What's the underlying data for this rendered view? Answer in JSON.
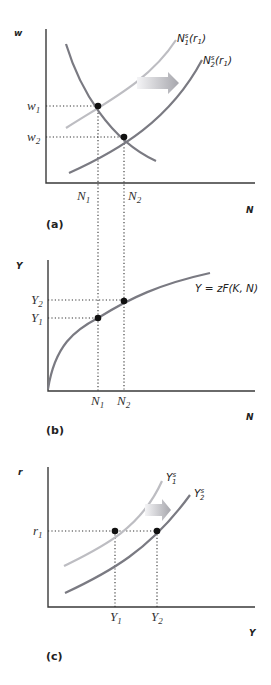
{
  "panels": [
    {
      "id": "a",
      "tag": "(a)",
      "y_axis_label": "w",
      "x_axis_label": "N",
      "y_ticks": {
        "w1": "w",
        "w1_sub": "1",
        "w2": "w",
        "w2_sub": "2"
      },
      "x_ticks": {
        "n1": "N",
        "n1_sub": "1",
        "n2": "N",
        "n2_sub": "2"
      },
      "curves": {
        "supply1": {
          "base": "N",
          "sup": "s",
          "sub": "1",
          "arg": "(r",
          "arg_sub": "1",
          "arg_close": ")"
        },
        "supply2": {
          "base": "N",
          "sup": "s",
          "sub": "2",
          "arg": "(r",
          "arg_sub": "1",
          "arg_close": ")"
        },
        "demand": "labor demand (unlabeled)"
      },
      "shift_arrow": "right"
    },
    {
      "id": "b",
      "tag": "(b)",
      "y_axis_label": "Y",
      "x_axis_label": "N",
      "y_ticks": {
        "y1": "Y",
        "y1_sub": "1",
        "y2": "Y",
        "y2_sub": "2"
      },
      "x_ticks": {
        "n1": "N",
        "n1_sub": "1",
        "n2": "N",
        "n2_sub": "2"
      },
      "curve_label": "Y = zF(K, N)"
    },
    {
      "id": "c",
      "tag": "(c)",
      "y_axis_label": "r",
      "x_axis_label": "Y",
      "y_ticks": {
        "r1": "r",
        "r1_sub": "1"
      },
      "x_ticks": {
        "y1": "Y",
        "y1_sub": "1",
        "y2": "Y",
        "y2_sub": "2"
      },
      "curves": {
        "supply1": {
          "base": "Y",
          "sup": "s",
          "sub": "1"
        },
        "supply2": {
          "base": "Y",
          "sup": "s",
          "sub": "2"
        }
      },
      "shift_arrow": "right"
    }
  ],
  "colors": {
    "curve_dark": "#7a7a82",
    "curve_light": "#bdbdc2",
    "axis": "#3a3a3a",
    "point": "#111111",
    "arrow_start": "#f2f2f4",
    "arrow_end": "#a8a8ae"
  }
}
